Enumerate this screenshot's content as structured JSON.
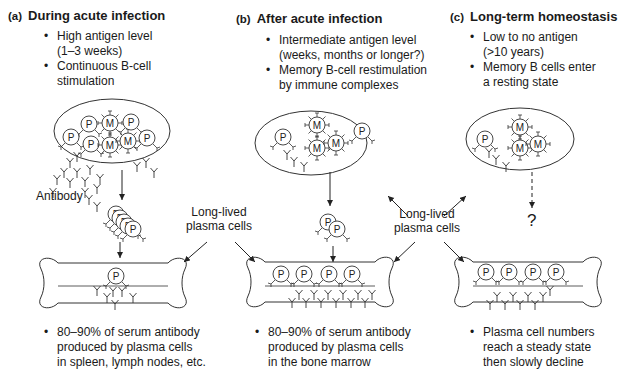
{
  "panels": [
    {
      "tag": "(a)",
      "title": "During acute infection",
      "bullets": [
        "High antigen level (1–3 weeks)",
        "Continuous B-cell stimulation"
      ],
      "bullet_lines": [
        [
          "High antigen level",
          "(1–3 weeks)"
        ],
        [
          "Continuous B-cell",
          "stimulation"
        ]
      ],
      "footer_lines": [
        "80–90% of serum antibody",
        "produced by plasma cells",
        "in spleen, lymph nodes, etc."
      ],
      "plasma_cells_in_bone": 1
    },
    {
      "tag": "(b)",
      "title": "After acute infection",
      "bullet_lines": [
        [
          "Intermediate antigen level",
          "(weeks, months or longer?)"
        ],
        [
          "Memory B-cell restimulation",
          "by immune complexes"
        ]
      ],
      "footer_lines": [
        "80–90% of serum antibody",
        "produced by plasma cells",
        "in the bone marrow"
      ],
      "plasma_cells_in_bone": 4
    },
    {
      "tag": "(c)",
      "title": "Long-term homeostasis",
      "bullet_lines": [
        [
          "Low to no antigen",
          "(>10 years)"
        ],
        [
          "Memory B cells enter",
          "a resting state"
        ]
      ],
      "footer_lines": [
        "Plasma cell numbers",
        "reach a steady state",
        "then slowly decline"
      ],
      "plasma_cells_in_bone": 4
    }
  ],
  "labels": {
    "antibody": "Antibody",
    "long_lived_1": [
      "Long-lived",
      "plasma cells"
    ],
    "long_lived_2": [
      "Long-lived",
      "plasma cells"
    ],
    "unknown": "?",
    "plasma_cell_glyph": "P",
    "memory_cell_glyph": "M"
  }
}
